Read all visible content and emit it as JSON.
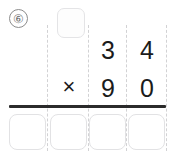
{
  "problem": {
    "number_label": "⑥",
    "operator": "×",
    "multiplicand": {
      "hundreds": "",
      "tens": "3",
      "ones": "4"
    },
    "multiplier": {
      "hundreds": "",
      "tens": "9",
      "ones": "0"
    },
    "carry_box_value": "",
    "answer_digits": [
      "",
      "",
      "",
      ""
    ]
  },
  "colors": {
    "rule": "#2b2b2b",
    "box_border": "#e2e2e4",
    "guide": "#d2d2d4",
    "digit": "#1b1b1b",
    "number_circle": "#8c8c8c"
  }
}
